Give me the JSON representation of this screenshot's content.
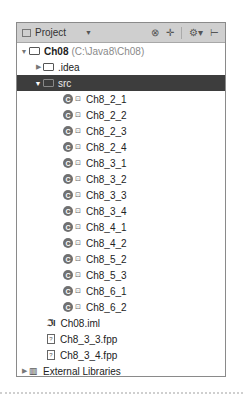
{
  "header": {
    "view_label": "Project",
    "icons": [
      "collapse-icon",
      "add-icon",
      "gear-icon",
      "hide-icon"
    ]
  },
  "tree": {
    "root": {
      "name": "Ch08",
      "path": "(C:\\Java8\\Ch08)"
    },
    "idea": ".idea",
    "src": "src",
    "classes": [
      "Ch8_2_1",
      "Ch8_2_2",
      "Ch8_2_3",
      "Ch8_2_4",
      "Ch8_3_1",
      "Ch8_3_2",
      "Ch8_3_3",
      "Ch8_3_4",
      "Ch8_4_1",
      "Ch8_4_2",
      "Ch8_5_2",
      "Ch8_5_3",
      "Ch8_6_1",
      "Ch8_6_2"
    ],
    "iml": "Ch08.iml",
    "files": [
      "Ch8_3_3.fpp",
      "Ch8_3_4.fpp"
    ],
    "external": "External Libraries"
  }
}
